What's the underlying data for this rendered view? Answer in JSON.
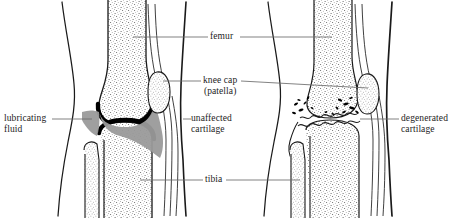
{
  "diagram": {
    "background_color": "#ffffff",
    "ink_color": "#1a1a1a",
    "leader_line_color": "#6b6b6b",
    "cartilage_color": "#000000",
    "fluid_color": "#9a9a9a",
    "bone_fill_color": "#ffffff",
    "stipple_color": "#4a4a4a"
  },
  "labels": {
    "femur": {
      "line1": "femur"
    },
    "knee_cap": {
      "line1": "knee cap",
      "line2": "(patella)"
    },
    "lubricating_fluid": {
      "line1": "lubricating",
      "line2": "fluid"
    },
    "unaffected_cartilage": {
      "line1": "unaffected",
      "line2": "cartilage"
    },
    "tibia": {
      "line1": "tibia"
    },
    "degenerated_cartilage": {
      "line1": "degenerated",
      "line2": "cartilage"
    }
  },
  "panels": {
    "left": {
      "name": "healthy-knee",
      "labels": [
        "lubricating fluid",
        "unaffected cartilage"
      ]
    },
    "right": {
      "name": "degenerated-knee",
      "labels": [
        "degenerated cartilage"
      ]
    },
    "shared_labels": [
      "femur",
      "knee cap (patella)",
      "tibia"
    ]
  }
}
